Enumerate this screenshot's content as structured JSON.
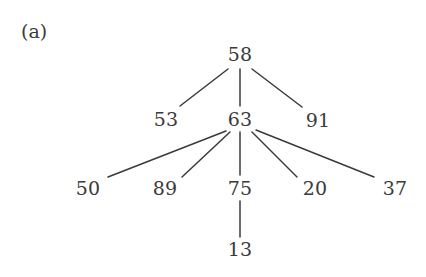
{
  "figure": {
    "panel_label": "(a)",
    "background_color": "#ffffff",
    "stroke_color": "#3a3a3a",
    "text_color": "#3a3a3a",
    "width": 426,
    "height": 277
  },
  "chart_data": {
    "type": "diagram",
    "diagram_type": "tree",
    "title": "(a)",
    "xlabel": "",
    "ylabel": "",
    "grid": false,
    "legend": false,
    "root": "58",
    "nodes": [
      {
        "id": "n58",
        "label": "58",
        "x": 240,
        "y": 54,
        "level": 0
      },
      {
        "id": "n53",
        "label": "53",
        "x": 166,
        "y": 119,
        "level": 1
      },
      {
        "id": "n63",
        "label": "63",
        "x": 240,
        "y": 119,
        "level": 1
      },
      {
        "id": "n91",
        "label": "91",
        "x": 318,
        "y": 120,
        "level": 1
      },
      {
        "id": "n50",
        "label": "50",
        "x": 88,
        "y": 188,
        "level": 2
      },
      {
        "id": "n89",
        "label": "89",
        "x": 165,
        "y": 188,
        "level": 2
      },
      {
        "id": "n75",
        "label": "75",
        "x": 240,
        "y": 188,
        "level": 2
      },
      {
        "id": "n20",
        "label": "20",
        "x": 315,
        "y": 188,
        "level": 2
      },
      {
        "id": "n37",
        "label": "37",
        "x": 395,
        "y": 188,
        "level": 2
      },
      {
        "id": "n13",
        "label": "13",
        "x": 240,
        "y": 249,
        "level": 3
      }
    ],
    "edges": [
      {
        "from": "n58",
        "to": "n53",
        "x1": 228,
        "y1": 69,
        "x2": 180,
        "y2": 106
      },
      {
        "from": "n58",
        "to": "n63",
        "x1": 240,
        "y1": 69,
        "x2": 240,
        "y2": 106
      },
      {
        "from": "n58",
        "to": "n91",
        "x1": 252,
        "y1": 69,
        "x2": 302,
        "y2": 107
      },
      {
        "from": "n63",
        "to": "n50",
        "x1": 226,
        "y1": 131,
        "x2": 108,
        "y2": 177
      },
      {
        "from": "n63",
        "to": "n89",
        "x1": 230,
        "y1": 132,
        "x2": 182,
        "y2": 177
      },
      {
        "from": "n63",
        "to": "n75",
        "x1": 240,
        "y1": 132,
        "x2": 240,
        "y2": 175
      },
      {
        "from": "n63",
        "to": "n20",
        "x1": 252,
        "y1": 132,
        "x2": 297,
        "y2": 177
      },
      {
        "from": "n63",
        "to": "n37",
        "x1": 256,
        "y1": 130,
        "x2": 374,
        "y2": 177
      },
      {
        "from": "n75",
        "to": "n13",
        "x1": 240,
        "y1": 201,
        "x2": 240,
        "y2": 237
      }
    ]
  }
}
